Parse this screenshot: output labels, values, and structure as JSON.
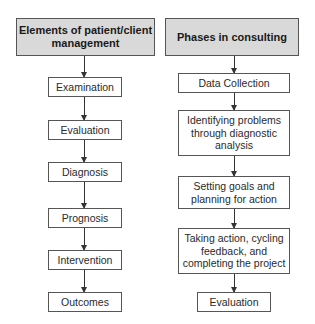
{
  "diagram": {
    "left_column": {
      "header": "Elements of patient/client management",
      "steps": [
        "Examination",
        "Evaluation",
        "Diagnosis",
        "Prognosis",
        "Intervention",
        "Outcomes"
      ]
    },
    "right_column": {
      "header": "Phases in consulting",
      "steps": [
        "Data Collection",
        "Identifying problems through diagnostic analysis",
        "Setting goals and planning for action",
        "Taking action, cycling feedback, and completing the project",
        "Evaluation"
      ]
    },
    "colors": {
      "header_fill": "#d9d9d9",
      "box_border": "#555555",
      "arrow": "#333333"
    }
  }
}
